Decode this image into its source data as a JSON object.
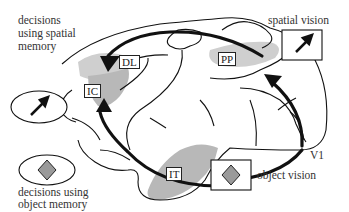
{
  "diagram": {
    "type": "brain-pathway-diagram",
    "labels": {
      "spatial_memory_decision": [
        "decisions",
        "using spatial",
        "memory"
      ],
      "object_memory_decision": [
        "decisions using",
        "object memory"
      ],
      "spatial_vision": "spatial vision",
      "object_vision": "object vision"
    },
    "regions": {
      "DL": "DL",
      "IC": "IC",
      "PP": "PP",
      "IT": "IT",
      "V1": "V1"
    },
    "icons": {
      "spatial": "arrow-icon",
      "object": "diamond-icon"
    },
    "colors": {
      "region_fill": "#b8b8b8",
      "region_fill_light": "#cfcfcf",
      "diamond_fill": "#9a9a9a",
      "stroke": "#111111"
    },
    "pathways": [
      {
        "from": "V1",
        "to": "PP",
        "name": "spatial pathway (dorsal)"
      },
      {
        "from": "PP",
        "to": "DL",
        "name": "spatial to prefrontal"
      },
      {
        "from": "V1",
        "to": "IT",
        "name": "object pathway (ventral)"
      },
      {
        "from": "IT",
        "to": "IC",
        "name": "object to prefrontal"
      }
    ]
  }
}
